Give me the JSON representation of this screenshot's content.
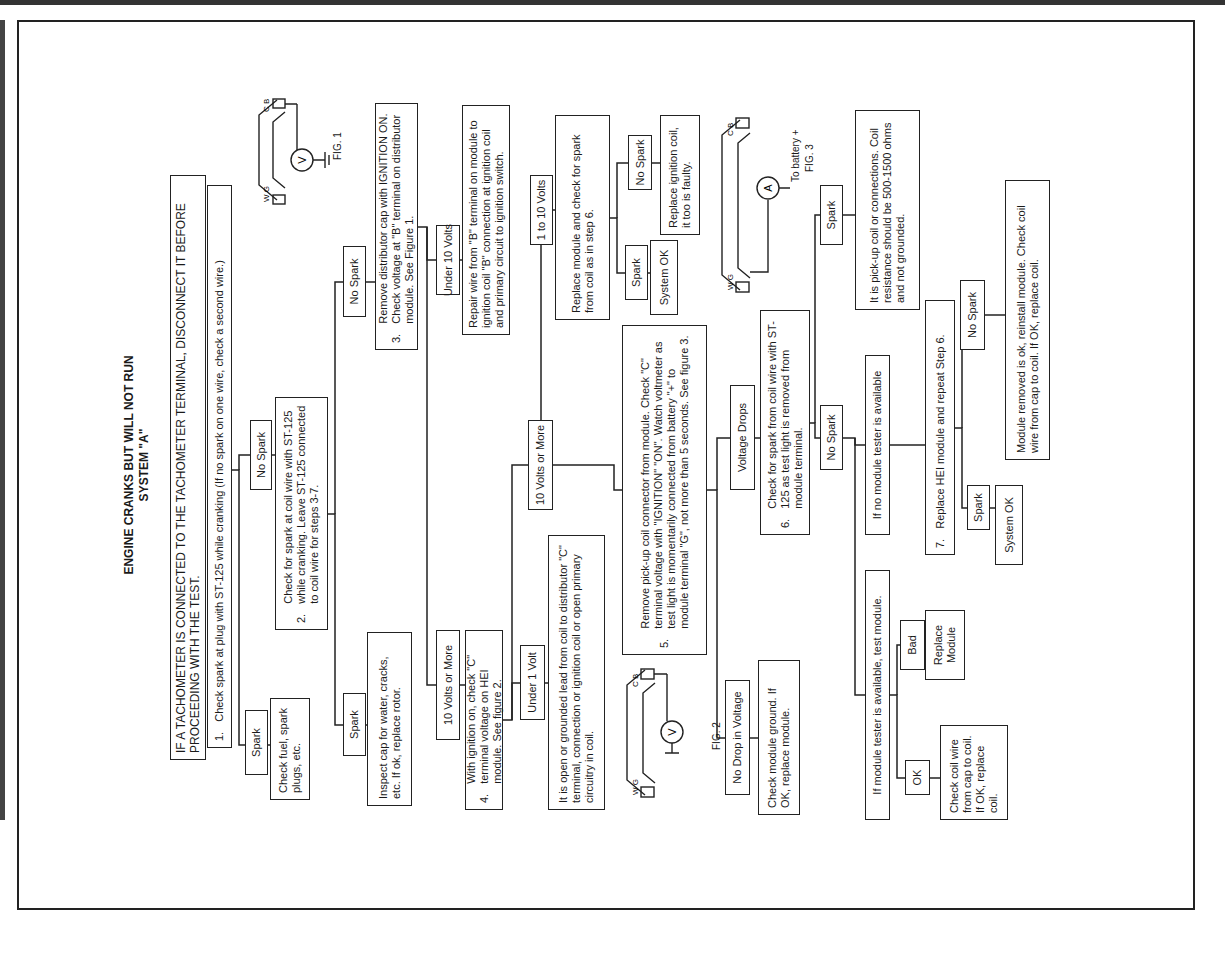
{
  "title": {
    "line1": "ENGINE CRANKS BUT WILL NOT RUN",
    "line2": "SYSTEM \"A\""
  },
  "warning": "IF A TACHOMETER IS CONNECTED TO THE TACHOMETER TERMINAL, DISCONNECT IT BEFORE PROCEEDING WITH THE TEST.",
  "steps": {
    "s1": {
      "num": "1.",
      "text": "Check spark at plug with ST-125 while cranking (If no spark on one wire, check a second wire.)"
    },
    "s2": {
      "num": "2.",
      "text": "Check for spark at coil wire with ST-125 while cranking. Leave ST-125 connected to coil wire for steps 3-7."
    },
    "s3": {
      "num": "3.",
      "text": "Remove distributor cap with IGNITION ON. Check voltage at \"B\" terminal on distributor module. See Figure 1."
    },
    "s4": {
      "num": "4.",
      "text": "With ignition on, check \"C\" terminal voltage on HEI module. See figure 2."
    },
    "s5": {
      "num": "5.",
      "text": "Remove pick-up coil connector from module. Check \"C\" terminal voltage with \"IGNITION\" \"ON\". Watch voltmeter as test light is momentarily connected from battery \"+\" to module terminal \"G\", not more than 5 seconds. See figure 3."
    },
    "s6": {
      "num": "6.",
      "text": "Check for spark from coil wire with ST-125 as test light is removed from module terminal."
    },
    "s7": {
      "num": "7.",
      "text": "Replace HEI module and repeat Step 6."
    }
  },
  "labels": {
    "spark": "Spark",
    "no_spark": "No Spark",
    "volts10_more": "10 Volts or More",
    "under10": "Under 10 Volts",
    "one_to_ten": "1 to 10 Volts",
    "under1": "Under 1 Volt",
    "voltage_drops": "Voltage Drops",
    "no_drop": "No Drop in Voltage",
    "bad": "Bad",
    "ok": "OK",
    "system_ok": "System OK"
  },
  "results": {
    "check_fuel": "Check fuel, spark plugs, etc.",
    "inspect_cap": "Inspect cap for water, cracks, etc. If ok, replace rotor.",
    "repair_wire": "Repair wire from \"B\" terminal on module to ignition coil \"B\" connection at ignition coil and primary circuit to ignition switch.",
    "replace_module_check": "Replace module and check for spark from coil as in step 6.",
    "replace_coil_faulty": "Replace ignition coil, it too is faulty.",
    "open_grounded": "It is open or grounded lead from coil to distributor \"C\" terminal, connection or ignition coil or open primary circuitry in coil.",
    "check_module_ground": "Check module ground. If OK, replace module.",
    "pickup_coil": "It is pick-up coil or connections. Coil resistance should be 500-1500 ohms and not grounded.",
    "no_tester": "If no module tester is available",
    "tester": "If module tester is available, test module.",
    "replace_module": "Replace Module",
    "check_coil_wire": "Check coil wire from cap to coil. If OK, replace coil.",
    "module_removed_ok": "Module removed is ok, reinstall module. Check coil wire from cap to coil. If OK, replace coil."
  },
  "figures": {
    "fig1": {
      "label": "FIG. 1",
      "meter": "V",
      "terminals": [
        "C",
        "B",
        "W",
        "G"
      ]
    },
    "fig2": {
      "label": "FIG. 2",
      "meter": "V",
      "terminals": [
        "C",
        "B",
        "W",
        "G"
      ]
    },
    "fig3": {
      "label": "FIG. 3",
      "meter": "A",
      "note": "To battery +",
      "terminals": [
        "C",
        "B",
        "W",
        "G"
      ]
    }
  }
}
